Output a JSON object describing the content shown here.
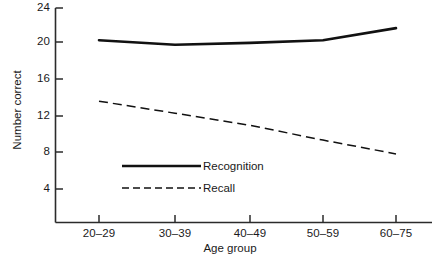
{
  "chart_data": {
    "type": "line",
    "title": "",
    "subtitle": "",
    "xlabel": "Age group",
    "ylabel": "Number correct",
    "categories": [
      "20–29",
      "30–39",
      "40–49",
      "50–59",
      "60–75"
    ],
    "yticks": [
      4,
      8,
      12,
      16,
      20,
      24
    ],
    "ytick_labels": [
      "4",
      "8",
      "12",
      "16",
      "20",
      "24"
    ],
    "ylim": [
      0,
      25
    ],
    "grid": false,
    "legend_position": "inside-lower-left",
    "series": [
      {
        "name": "Recognition",
        "style": "solid",
        "color": "#111111",
        "values": [
          20.2,
          19.7,
          19.9,
          20.2,
          21.5
        ]
      },
      {
        "name": "Recall",
        "style": "dashed",
        "color": "#111111",
        "values": [
          13.6,
          12.3,
          11.0,
          9.4,
          7.9
        ]
      }
    ],
    "annotations": []
  },
  "legend": {
    "items": [
      {
        "label": "Recognition",
        "style": "solid"
      },
      {
        "label": "Recall",
        "style": "dashed"
      }
    ]
  },
  "axes": {
    "y_label": "Number correct",
    "x_label": "Age group",
    "y_tick_labels": [
      "24",
      "20",
      "16",
      "12",
      "8",
      "4"
    ],
    "x_tick_labels": [
      "20–29",
      "30–39",
      "40–49",
      "50–59",
      "60–75"
    ]
  }
}
